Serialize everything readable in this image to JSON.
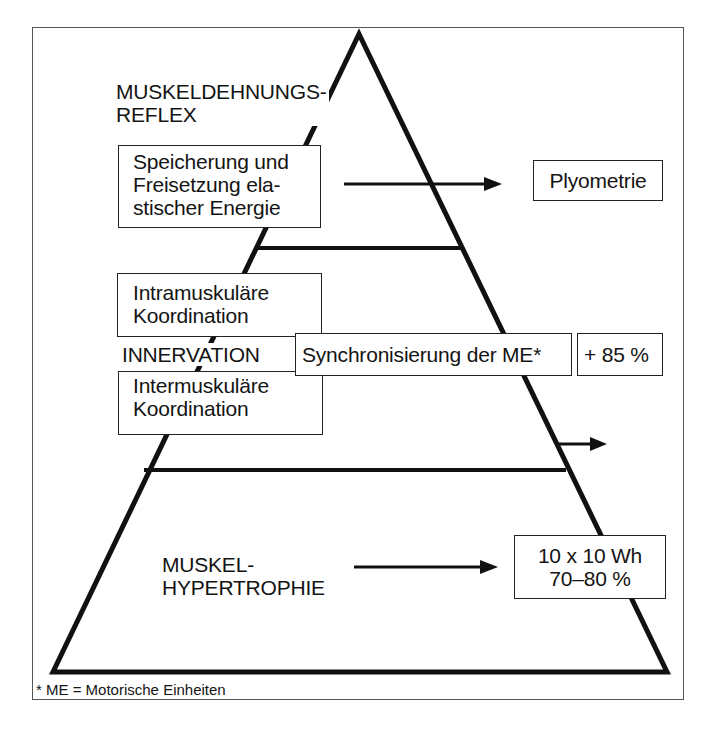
{
  "diagram": {
    "type": "pyramid",
    "levels": [
      {
        "position": "top",
        "title_lines": [
          "MUSKELDEHNUNGS-",
          "REFLEX"
        ],
        "box_lines": [
          "Speicherung und",
          "Freisetzung ela-",
          "stischer Energie"
        ],
        "arrow_target": "Plyometrie"
      },
      {
        "position": "middle",
        "upper_box_lines": [
          "Intramuskuläre",
          "Koordination"
        ],
        "center_label": "INNERVATION",
        "sync_box": "Synchronisierung der ME*",
        "sync_value": "+ 85 %",
        "lower_box_lines": [
          "Intermuskuläre",
          "Koordination"
        ]
      },
      {
        "position": "base",
        "title_lines": [
          "MUSKEL-",
          "HYPERTROPHIE"
        ],
        "arrow_target_lines": [
          "10 x 10 Wh",
          "70–80 %"
        ]
      }
    ],
    "footnote": "* ME = Motorische Einheiten",
    "colors": {
      "line": "#111111",
      "frame": "#555555",
      "background": "#ffffff"
    }
  }
}
